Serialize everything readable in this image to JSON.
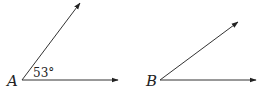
{
  "figure": {
    "angles": [
      {
        "vertex_label": "A",
        "measure_label": "53°",
        "vertex": [
          22,
          80
        ],
        "ray_horizontal_end": [
          118,
          80
        ],
        "ray_upper_end": [
          80,
          3
        ]
      },
      {
        "vertex_label": "B",
        "measure_label": "",
        "vertex": [
          160,
          80
        ],
        "ray_horizontal_end": [
          256,
          80
        ],
        "ray_upper_end": [
          238,
          22
        ]
      }
    ],
    "line_color": "#333333",
    "text_color": "#222222"
  }
}
